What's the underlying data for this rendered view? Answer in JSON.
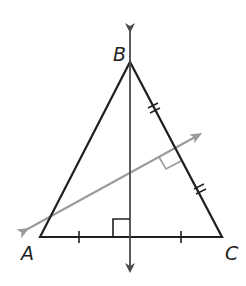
{
  "diagram": {
    "type": "geometry",
    "colors": {
      "triangle": "#231f20",
      "vertical_bisector": "#231f20",
      "slanted_bisector": "#9a9a9a",
      "background": "#ffffff"
    },
    "vertices": {
      "A": {
        "label": "A",
        "x": 40,
        "y": 237
      },
      "B": {
        "label": "B",
        "x": 130,
        "y": 62
      },
      "C": {
        "label": "C",
        "x": 222,
        "y": 237
      }
    },
    "bisectors": [
      {
        "name": "perpendicular bisector of AC",
        "through": "B",
        "direction": "vertical",
        "arrows": "both"
      },
      {
        "name": "perpendicular bisector of BC",
        "direction": "slanted",
        "arrows": "both"
      }
    ],
    "markings": {
      "AC_single_ticks": 2,
      "BC_double_ticks": 2,
      "right_angles": 2
    }
  }
}
